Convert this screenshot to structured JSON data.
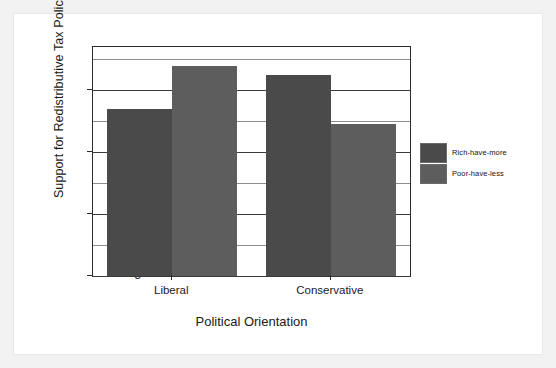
{
  "chart_data": {
    "type": "bar",
    "title": "",
    "xlabel": "Political Orientation",
    "ylabel": "Support for Redistributive Tax Policies",
    "categories": [
      "Liberal",
      "Conservative"
    ],
    "series": [
      {
        "name": "Rich-have-more",
        "values": [
          5.7,
          6.25
        ],
        "color": "#4a4a4a"
      },
      {
        "name": "Poor-have-less",
        "values": [
          6.4,
          5.45
        ],
        "color": "#5d5d5d"
      }
    ],
    "ylim": [
      3,
      6.7
    ],
    "yticks": [
      3,
      4,
      5,
      6
    ],
    "ytick_labels": [
      "3",
      "4",
      "5",
      "6"
    ],
    "gridlines_minor_step": 0.5,
    "grid": true,
    "legend_position": "right"
  },
  "figure": {
    "background": "#ffffff",
    "page_background": "#f2f2f2",
    "axis_color": "#2b2b2b"
  },
  "legend": {
    "items": [
      {
        "label": "Rich-have-more",
        "color": "#4a4a4a"
      },
      {
        "label": "Poor-have-less",
        "color": "#5d5d5d"
      }
    ]
  }
}
